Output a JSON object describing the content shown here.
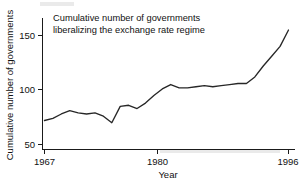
{
  "chart_data": {
    "type": "line",
    "title": "Cumulative number of governments liberalizing the exchange rate regime",
    "title_line1": "Cumulative number of governments",
    "title_line2": "liberalizing the exchange rate regime",
    "xlabel": "Year",
    "ylabel": "Cumulative number of governments",
    "xlim": [
      1967,
      1996
    ],
    "ylim": [
      46,
      160
    ],
    "xticks": [
      1967,
      1980,
      1996
    ],
    "xtick_labels": [
      "1967",
      "1980",
      "1996"
    ],
    "yticks": [
      50,
      100,
      150
    ],
    "ytick_labels": [
      "50",
      "100",
      "150"
    ],
    "grid": false,
    "legend": "none",
    "line_color": "#272727",
    "axis_color": "#1a1a1a",
    "background_color": "#ffffff",
    "series": [
      {
        "name": "Cumulative number of governments",
        "x": [
          1967,
          1968,
          1969,
          1970,
          1971,
          1972,
          1973,
          1974,
          1975,
          1976,
          1977,
          1978,
          1979,
          1980,
          1981,
          1982,
          1983,
          1984,
          1985,
          1986,
          1987,
          1988,
          1989,
          1990,
          1991,
          1992,
          1993,
          1994,
          1995,
          1996
        ],
        "values": [
          72,
          74,
          78,
          81,
          79,
          78,
          79,
          76,
          70,
          85,
          86,
          83,
          88,
          95,
          101,
          105,
          102,
          102,
          103,
          104,
          103,
          104,
          105,
          106,
          106,
          112,
          122,
          131,
          140,
          155
        ]
      }
    ]
  }
}
